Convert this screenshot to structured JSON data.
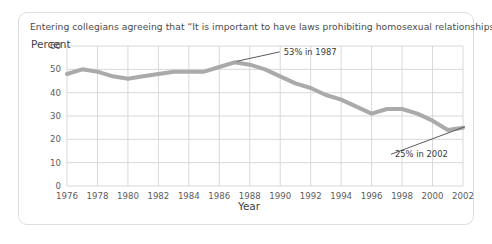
{
  "figure": {
    "title": "Entering collegians agreeing that “It is important to have laws prohibiting homosexual relationships.”",
    "border_color": "#dedede",
    "background": "#ffffff"
  },
  "chart_data": {
    "type": "line",
    "title": "Entering collegians agreeing that “It is important to have laws prohibiting homosexual relationships.”",
    "xlabel": "Year",
    "ylabel": "Percent",
    "xlim": [
      1976,
      2002
    ],
    "ylim": [
      0,
      60
    ],
    "ytick_values": [
      0,
      10,
      20,
      30,
      40,
      50,
      60
    ],
    "ytick_labels": [
      "0",
      "10",
      "20",
      "30",
      "40",
      "50",
      "60"
    ],
    "xtick_values": [
      1976,
      1978,
      1980,
      1982,
      1984,
      1986,
      1988,
      1990,
      1992,
      1994,
      1996,
      1998,
      2000,
      2002
    ],
    "xtick_labels": [
      "1976",
      "1978",
      "1980",
      "1982",
      "1984",
      "1986",
      "1988",
      "1990",
      "1992",
      "1994",
      "1996",
      "1998",
      "2000",
      "2002"
    ],
    "grid": true,
    "grid_color": "#d8d8d8",
    "line_color": "#aaaaaa",
    "line_width": 4,
    "legend": false,
    "x": [
      1976,
      1977,
      1978,
      1979,
      1980,
      1981,
      1982,
      1983,
      1984,
      1985,
      1986,
      1987,
      1988,
      1989,
      1990,
      1991,
      1992,
      1993,
      1994,
      1995,
      1996,
      1997,
      1998,
      1999,
      2000,
      2001,
      2002
    ],
    "values": [
      48,
      50,
      49,
      47,
      46,
      47,
      48,
      49,
      49,
      49,
      51,
      53,
      52,
      50,
      47,
      44,
      42,
      39,
      37,
      34,
      31,
      33,
      33,
      31,
      28,
      24,
      25
    ],
    "annotations": [
      {
        "label": "53% in 1987",
        "point_x": 1987,
        "point_y": 53,
        "text_x": 1990.1,
        "text_y": 56.2
      },
      {
        "label": "25% in 2002",
        "point_x": 2002,
        "point_y": 25,
        "text_x": 1997.4,
        "text_y": 12.3
      }
    ]
  }
}
